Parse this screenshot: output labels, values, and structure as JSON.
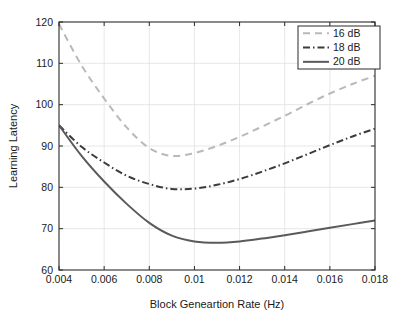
{
  "chart_data": {
    "type": "line",
    "title": "",
    "xlabel": "Block Geneartion Rate (Hz)",
    "ylabel": "Learning Latency",
    "xlim": [
      0.004,
      0.018
    ],
    "ylim": [
      60,
      120
    ],
    "grid": true,
    "legend_position": "top-right",
    "xticks": [
      0.004,
      0.006,
      0.008,
      0.01,
      0.012,
      0.014,
      0.016,
      0.018
    ],
    "xtick_labels": [
      "0.004",
      "0.006",
      "0.008",
      "0.01",
      "0.012",
      "0.014",
      "0.016",
      "0.018"
    ],
    "yticks": [
      60,
      70,
      80,
      90,
      100,
      110,
      120
    ],
    "ytick_labels": [
      "60",
      "70",
      "80",
      "90",
      "100",
      "110",
      "120"
    ],
    "x": [
      0.004,
      0.005,
      0.006,
      0.007,
      0.008,
      0.009,
      0.01,
      0.011,
      0.012,
      0.013,
      0.014,
      0.015,
      0.016,
      0.017,
      0.018
    ],
    "series": [
      {
        "name": "16 dB",
        "label": "16 dB",
        "style": "dashed",
        "color": "#b9b9b9",
        "width": 2.0,
        "values": [
          119.5,
          109.5,
          101.5,
          94.5,
          89.5,
          87.6,
          88.3,
          90.0,
          92.2,
          94.7,
          97.3,
          100.1,
          102.7,
          105.0,
          107.0
        ]
      },
      {
        "name": "18 dB",
        "label": "18 dB",
        "style": "dash-dot",
        "color": "#3b3b3b",
        "width": 2.0,
        "values": [
          95.0,
          89.8,
          86.0,
          82.8,
          80.8,
          79.6,
          79.7,
          80.6,
          82.0,
          83.8,
          85.8,
          88.0,
          90.2,
          92.3,
          94.2
        ]
      },
      {
        "name": "20 dB",
        "label": "20 dB",
        "style": "solid",
        "color": "#5a5a5a",
        "width": 2.0,
        "values": [
          95.0,
          87.6,
          81.4,
          76.0,
          71.4,
          68.3,
          66.9,
          66.6,
          66.9,
          67.6,
          68.4,
          69.3,
          70.2,
          71.1,
          72.0
        ]
      }
    ]
  },
  "axes": {
    "ylabel": "Learning Latency",
    "xlabel": "Block Geneartion Rate (Hz)"
  },
  "legend": {
    "entries": [
      {
        "label": "16 dB"
      },
      {
        "label": "18 dB"
      },
      {
        "label": "20 dB"
      }
    ]
  },
  "colors": {
    "series_16db": "#b9b9b9",
    "series_18db": "#3b3b3b",
    "series_20db": "#5a5a5a",
    "axis": "#2b2b2b",
    "grid": "#dcdcdc",
    "background": "#ffffff"
  }
}
